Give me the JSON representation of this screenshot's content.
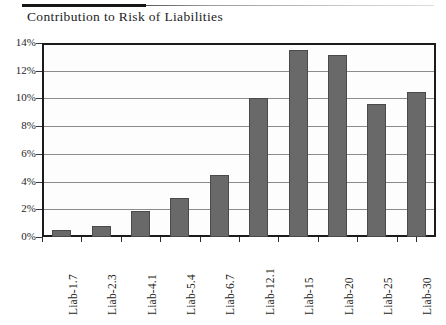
{
  "chart_data": {
    "type": "bar",
    "title": "Contribution to Risk of Liabilities",
    "xlabel": "",
    "ylabel": "",
    "categories": [
      "Liab-1.7",
      "Liab-2.3",
      "Liab-4.1",
      "Liab-5.4",
      "Liab-6.7",
      "Liab-12.1",
      "Liab-15",
      "Liab-20",
      "Liab-25",
      "Liab-30"
    ],
    "values": [
      0.5,
      0.8,
      1.9,
      2.8,
      4.5,
      10.0,
      13.5,
      13.1,
      9.6,
      10.5
    ],
    "value_unit": "%",
    "ylim": [
      0,
      14
    ],
    "ytick_labels": [
      "0%",
      "2%",
      "4%",
      "6%",
      "8%",
      "10%",
      "12%",
      "14%"
    ],
    "ytick_values": [
      0,
      2,
      4,
      6,
      8,
      10,
      12,
      14
    ],
    "grid": true,
    "legend": false,
    "bar_color": "#696969",
    "bar_border_color": "#4a4a4a",
    "gridline_color": "#8c8c90",
    "axis_color": "#1b1b1e",
    "plot_background": "#fdfdfd"
  },
  "header": {
    "rule_color_left": "#17171a",
    "rule_color_right": "#c9c9cc"
  }
}
